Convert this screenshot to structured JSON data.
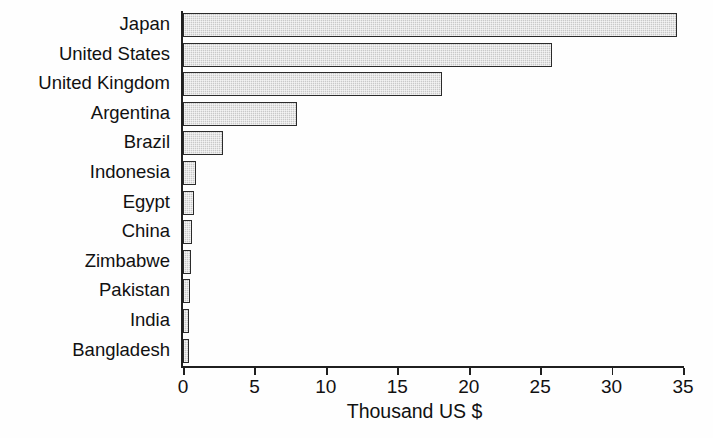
{
  "chart_data": {
    "type": "bar",
    "orientation": "horizontal",
    "title": "",
    "xlabel": "Thousand US $",
    "ylabel": "",
    "xlim": [
      0,
      35
    ],
    "xticks": [
      0,
      5,
      10,
      15,
      20,
      25,
      30,
      35
    ],
    "xtick_labels": [
      "0",
      "5",
      "10",
      "15",
      "20",
      "25",
      "30",
      "35"
    ],
    "grid": false,
    "legend": null,
    "categories": [
      "Japan",
      "United States",
      "United Kingdom",
      "Argentina",
      "Brazil",
      "Indonesia",
      "Egypt",
      "China",
      "Zimbabwe",
      "Pakistan",
      "India",
      "Bangladesh"
    ],
    "values": [
      34.6,
      25.8,
      18.1,
      8.0,
      2.8,
      0.9,
      0.8,
      0.65,
      0.55,
      0.5,
      0.4,
      0.3
    ],
    "series": [
      {
        "name": "Income per capita",
        "values": [
          34.6,
          25.8,
          18.1,
          8.0,
          2.8,
          0.9,
          0.8,
          0.65,
          0.55,
          0.5,
          0.4,
          0.3
        ]
      }
    ],
    "colors": {
      "bar_fill": "#c9c9c9",
      "bar_border": "#2b2b2b",
      "axis": "#1f1f1f",
      "text": "#111111",
      "background": "#ffffff"
    }
  }
}
